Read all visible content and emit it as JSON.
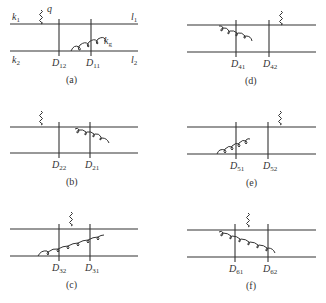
{
  "panels": [
    {
      "id": "a",
      "caption": "(a)",
      "labels": {
        "k1": "k",
        "k1_sub": "1",
        "k2": "k",
        "k2_sub": "2",
        "l1": "l",
        "l1_sub": "1",
        "l2": "l",
        "l2_sub": "2",
        "q": "q",
        "kg": "k",
        "kg_sub": "g"
      },
      "cuts": [
        {
          "name": "D",
          "sub": "12"
        },
        {
          "name": "D",
          "sub": "11"
        }
      ]
    },
    {
      "id": "b",
      "caption": "(b)",
      "cuts": [
        {
          "name": "D",
          "sub": "22"
        },
        {
          "name": "D",
          "sub": "21"
        }
      ]
    },
    {
      "id": "c",
      "caption": "(c)",
      "cuts": [
        {
          "name": "D",
          "sub": "32"
        },
        {
          "name": "D",
          "sub": "31"
        }
      ]
    },
    {
      "id": "d",
      "caption": "(d)",
      "cuts": [
        {
          "name": "D",
          "sub": "41"
        },
        {
          "name": "D",
          "sub": "42"
        }
      ]
    },
    {
      "id": "e",
      "caption": "(e)",
      "cuts": [
        {
          "name": "D",
          "sub": "51"
        },
        {
          "name": "D",
          "sub": "52"
        }
      ]
    },
    {
      "id": "f",
      "caption": "(f)",
      "cuts": [
        {
          "name": "D",
          "sub": "61"
        },
        {
          "name": "D",
          "sub": "62"
        }
      ]
    }
  ]
}
